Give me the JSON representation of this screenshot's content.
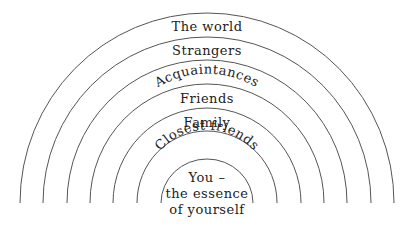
{
  "diagram": {
    "type": "concentric-semicircles",
    "center": {
      "x": 207,
      "y": 203
    },
    "colors": {
      "background": "#ffffff",
      "line": "#555555",
      "text": "#222222"
    },
    "rings": [
      {
        "label": "The world",
        "radius": 187,
        "curved": false
      },
      {
        "label": "Strangers",
        "radius": 164,
        "curved": false
      },
      {
        "label": "Acquaintances",
        "radius": 140,
        "curved": true
      },
      {
        "label": "Friends",
        "radius": 117,
        "curved": false
      },
      {
        "label": "Family",
        "radius": 94,
        "curved": false
      },
      {
        "label": "Closest friends",
        "radius": 70,
        "curved": true
      },
      {
        "label": "You –",
        "radius": 46,
        "curved": false
      }
    ],
    "core": {
      "line1": "You –",
      "line2": "the essence",
      "line3": "of yourself"
    }
  }
}
